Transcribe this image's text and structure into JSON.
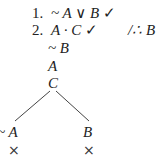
{
  "proof": {
    "lines": [
      {
        "num": "1.",
        "formula": "~ A ∨ B",
        "check": "✓"
      },
      {
        "num": "2.",
        "formula": "A · C",
        "check": "✓"
      }
    ],
    "conclusion": "/∴ B",
    "derived": [
      "~ B",
      "A",
      "C"
    ],
    "branches": {
      "left": {
        "formula": "~ A",
        "closed": "×"
      },
      "right": {
        "formula": "B",
        "closed": "×"
      }
    }
  }
}
